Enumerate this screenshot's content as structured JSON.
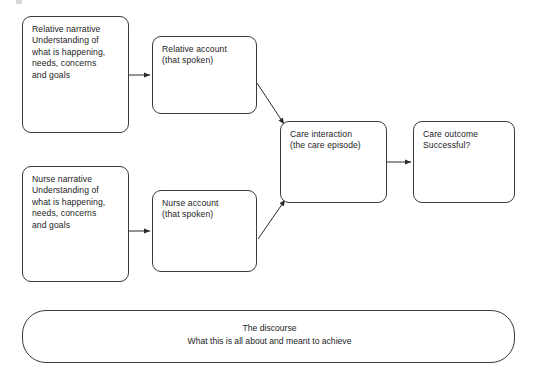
{
  "diagram": {
    "background_color": "#ffffff",
    "stroke_color": "#3b3b3b",
    "text_color": "#1d1d1d",
    "nodes": [
      {
        "id": "relative-narrative",
        "text": "Relative narrative\nUnderstanding of\nwhat is happening,\nneeds, concerns\nand goals"
      },
      {
        "id": "relative-account",
        "text": "Relative account\n(that spoken)"
      },
      {
        "id": "nurse-narrative",
        "text": "Nurse narrative\nUnderstanding of\nwhat is happening,\nneeds, concerns\nand goals"
      },
      {
        "id": "nurse-account",
        "text": "Nurse account\n(that spoken)"
      },
      {
        "id": "care-interaction",
        "text": "Care interaction\n(the care episode)"
      },
      {
        "id": "care-outcome",
        "text": "Care outcome\nSuccessful?"
      }
    ],
    "discourse": {
      "title": "The discourse",
      "subtitle": "What this is all about and meant to achieve"
    },
    "edges": [
      {
        "id": "relative-narrative-to-relative-account",
        "from": "relative-narrative",
        "to": "relative-account",
        "style": "arrow"
      },
      {
        "id": "nurse-narrative-to-nurse-account",
        "from": "nurse-narrative",
        "to": "nurse-account",
        "style": "arrow"
      },
      {
        "id": "relative-account-to-care-interaction",
        "from": "relative-account",
        "to": "care-interaction",
        "style": "arrow"
      },
      {
        "id": "nurse-account-to-care-interaction",
        "from": "nurse-account",
        "to": "care-interaction",
        "style": "arrow"
      },
      {
        "id": "care-interaction-to-care-outcome",
        "from": "care-interaction",
        "to": "care-outcome",
        "style": "arrow"
      },
      {
        "id": "discourse-arrow-left",
        "from": "discourse-start",
        "to": "discourse-label",
        "style": "arrow"
      },
      {
        "id": "discourse-arrow-right",
        "from": "discourse-label",
        "to": "discourse-end",
        "style": "arrow"
      }
    ]
  }
}
